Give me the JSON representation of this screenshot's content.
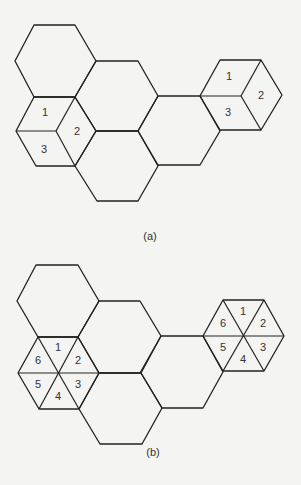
{
  "panels": [
    {
      "caption": "(a)",
      "sectorization": "3-sector",
      "left_cell_labels": [
        "1",
        "2",
        "3"
      ],
      "right_cell_labels": [
        "1",
        "2",
        "3"
      ]
    },
    {
      "caption": "(b)",
      "sectorization": "6-sector",
      "left_cell_labels": [
        "1",
        "2",
        "3",
        "4",
        "5",
        "6"
      ],
      "right_cell_labels": [
        "1",
        "2",
        "3",
        "4",
        "5",
        "6"
      ]
    }
  ]
}
